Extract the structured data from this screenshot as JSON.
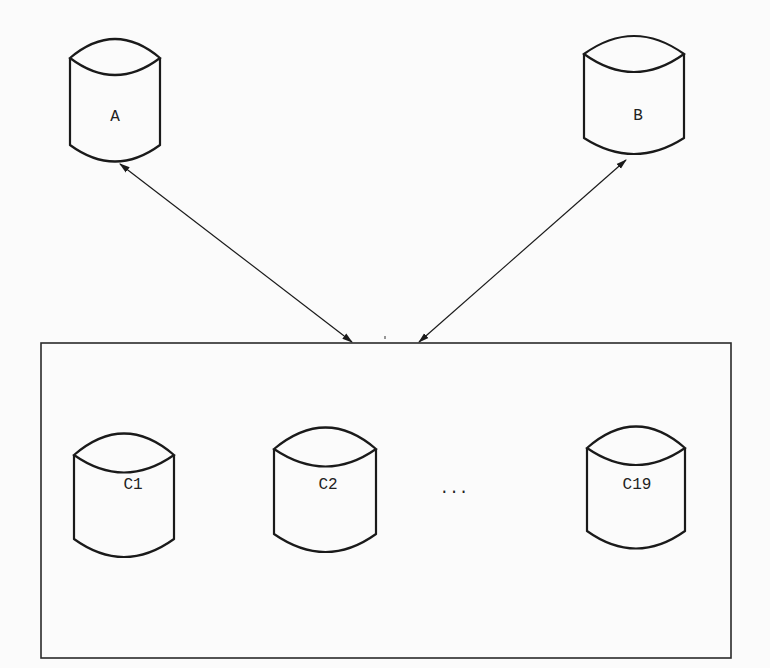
{
  "diagram": {
    "top_nodes": [
      {
        "id": "A",
        "label": "A"
      },
      {
        "id": "B",
        "label": "B"
      }
    ],
    "container": {
      "nodes": [
        {
          "id": "C1",
          "label": "C1"
        },
        {
          "id": "C2",
          "label": "C2"
        },
        {
          "id": "C19",
          "label": "C19"
        }
      ],
      "ellipsis": "..."
    },
    "edges": [
      {
        "from": "A",
        "to": "container",
        "bidirectional": true
      },
      {
        "from": "B",
        "to": "container",
        "bidirectional": true
      }
    ],
    "colors": {
      "stroke": "#1a1a1a",
      "background": "#fbfbfb"
    }
  }
}
